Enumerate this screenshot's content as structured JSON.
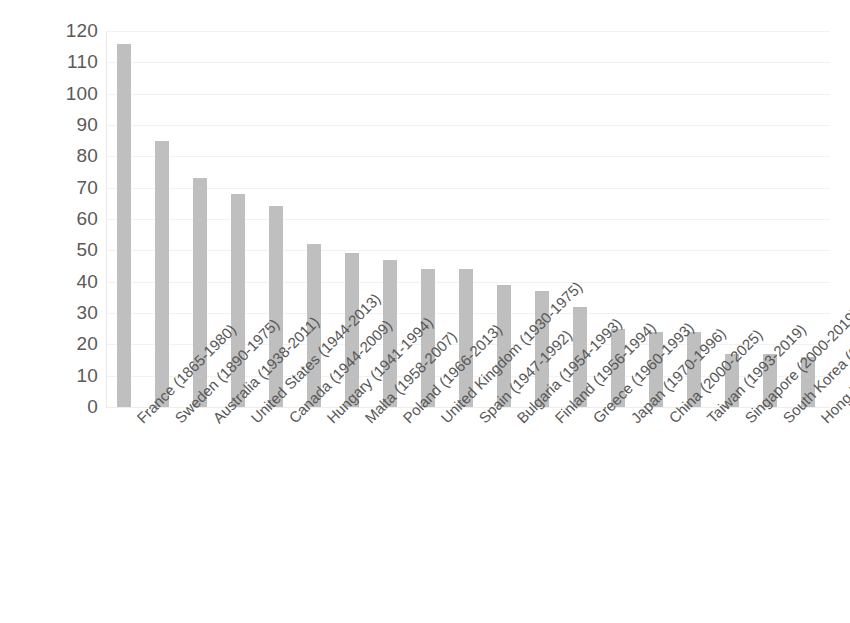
{
  "chart": {
    "title": "",
    "background_color": "#ffffff",
    "bar_color": "#bfbfbf",
    "gridline_color": "#f2f2f2",
    "axis_color": "#e8e8e8",
    "text_color": "#595959"
  },
  "chart_data": {
    "type": "bar",
    "title": "",
    "xlabel": "",
    "ylabel": "",
    "ylim": [
      0,
      120
    ],
    "ytick_step": 10,
    "yticks": [
      0,
      10,
      20,
      30,
      40,
      50,
      60,
      70,
      80,
      90,
      100,
      110,
      120
    ],
    "ytick_labels": [
      "0",
      "10",
      "20",
      "30",
      "40",
      "50",
      "60",
      "70",
      "80",
      "90",
      "100",
      "110",
      "120"
    ],
    "grid": true,
    "grid_axis": "y",
    "legend": false,
    "legend_position": "none",
    "orientation": "vertical",
    "categories": [
      "France (1865-1980)",
      "Sweden (1890-1975)",
      "Australia (1938-2011)",
      "United States (1944-2013)",
      "Canada (1944-2009)",
      "Hungary (1941-1994)",
      "Malta (1958-2007)",
      "Poland (1966-2013)",
      "United Kingdom (1930-1975)",
      "Spain (1947-1992)",
      "Bulgaria (1954-1993)",
      "Finland (1956-1994)",
      "Greece (1960-1993)",
      "Japan (1970-1996)",
      "China (2000-2025)",
      "Taiwan (1993-2019)",
      "Singapore (2000-2019)",
      "South Korea (2000-2019)",
      "Hong Kong (1995-2013)"
    ],
    "values": [
      116,
      85,
      73,
      68,
      64,
      52,
      49,
      47,
      44,
      44,
      39,
      37,
      32,
      25,
      24,
      24,
      17,
      17,
      16
    ]
  }
}
